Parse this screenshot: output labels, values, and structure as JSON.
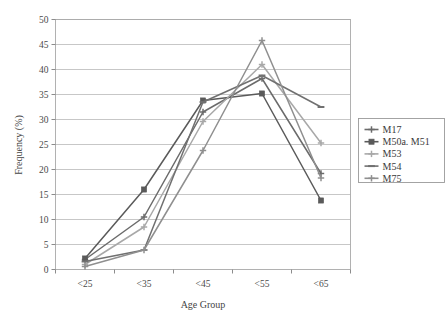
{
  "chart_data": {
    "type": "line",
    "title": "",
    "xlabel": "Age Group",
    "ylabel": "Frequency (%)",
    "categories": [
      "<25",
      "<35",
      "<45",
      "<55",
      "<65"
    ],
    "ylim": [
      0,
      50
    ],
    "yticks": [
      0,
      5,
      10,
      15,
      20,
      25,
      30,
      35,
      40,
      45,
      50
    ],
    "ytick_labels": [
      "0",
      "5",
      "10",
      "15",
      "20",
      "25",
      "30",
      "35",
      "40",
      "45",
      "50"
    ],
    "grid": true,
    "legend_position": "right",
    "series": [
      {
        "name": "M17",
        "values": [
          2.0,
          10.5,
          31.5,
          38.2,
          19.2
        ],
        "color": "#6b6b6b",
        "marker": "cross"
      },
      {
        "name": "M50a. M51",
        "values": [
          2.2,
          16.0,
          33.8,
          35.2,
          13.8
        ],
        "color": "#5a5a5a",
        "marker": "square"
      },
      {
        "name": "M53",
        "values": [
          1.0,
          8.5,
          29.6,
          41.0,
          25.3
        ],
        "color": "#a8a8a8",
        "marker": "cross"
      },
      {
        "name": "M54",
        "values": [
          1.6,
          3.9,
          33.5,
          38.8,
          32.5
        ],
        "color": "#707070",
        "marker": "dash"
      },
      {
        "name": "M75",
        "values": [
          0.6,
          3.9,
          23.8,
          45.8,
          18.3
        ],
        "color": "#8f8f8f",
        "marker": "cross"
      }
    ]
  },
  "legend": {
    "entries": [
      "M17",
      "M50a. M51",
      "M53",
      "M54",
      "M75"
    ]
  },
  "axis": {
    "x_title": "Age Group",
    "y_title": "Frequency (%)"
  }
}
